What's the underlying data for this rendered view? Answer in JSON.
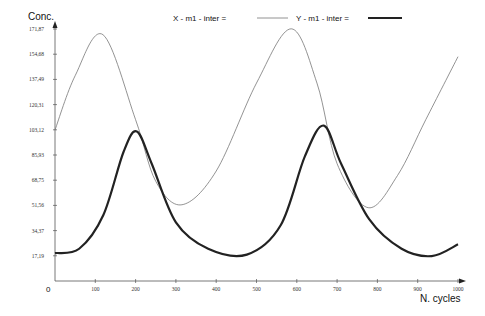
{
  "chart_data": {
    "type": "line",
    "title": "",
    "xlabel": "N. cycles",
    "ylabel": "Conc.",
    "origin_label": "0",
    "xlim": [
      0,
      1000
    ],
    "ylim": [
      0,
      171.87
    ],
    "grid": false,
    "legend_position": "top-center",
    "x_ticks": [
      100,
      200,
      300,
      400,
      500,
      600,
      700,
      800,
      900,
      1000
    ],
    "y_ticks": [
      "17,19",
      "34,37",
      "51,56",
      "68,75",
      "85,93",
      "103,12",
      "120,31",
      "137,49",
      "154,68",
      "171,87"
    ],
    "y_tick_values": [
      17.19,
      34.37,
      51.56,
      68.75,
      85.93,
      103.12,
      120.31,
      137.49,
      154.68,
      171.87
    ],
    "series": [
      {
        "name": "X - m1 - inter =",
        "style": "thin",
        "color": "#777777",
        "x": [
          0,
          50,
          119,
          200,
          250,
          315,
          400,
          500,
          586,
          650,
          700,
          777,
          850,
          920,
          1000
        ],
        "values": [
          103,
          140,
          168,
          110,
          68,
          52,
          75,
          135,
          172,
          135,
          80,
          50,
          72,
          110,
          153
        ]
      },
      {
        "name": "Y - m1 - inter =",
        "style": "thick",
        "color": "#222222",
        "x": [
          0,
          60,
          120,
          170,
          203,
          240,
          300,
          380,
          476,
          560,
          620,
          667,
          710,
          780,
          860,
          935,
          1000
        ],
        "values": [
          19,
          22,
          45,
          88,
          102,
          80,
          40,
          22,
          18,
          38,
          85,
          106,
          80,
          42,
          22,
          17,
          25
        ]
      }
    ]
  }
}
